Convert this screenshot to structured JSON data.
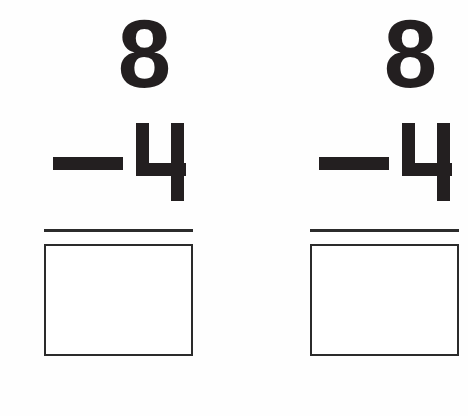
{
  "worksheet": {
    "type": "subtraction-practice",
    "background_color": "#fefefe",
    "ink_color": "#231f20",
    "rule_color": "#2b2b2b",
    "problems": [
      {
        "id": "problem-1",
        "minuend": "8",
        "operator": "−",
        "subtrahend": "4",
        "answer": ""
      },
      {
        "id": "problem-2",
        "minuend": "8",
        "operator": "−",
        "subtrahend": "4",
        "answer": ""
      }
    ]
  }
}
